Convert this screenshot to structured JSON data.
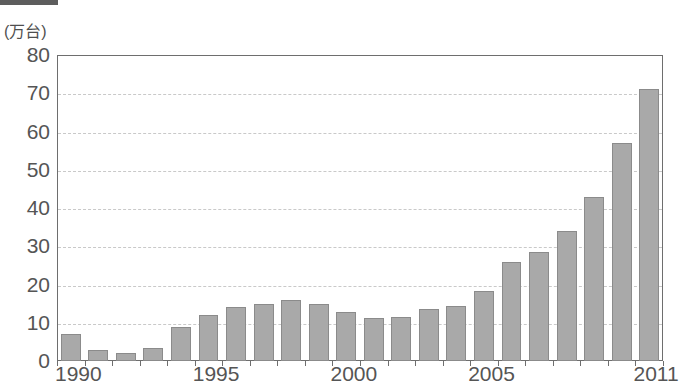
{
  "caption": {
    "tag_label": "",
    "text": ""
  },
  "chart_data": {
    "type": "bar",
    "title": "",
    "subtitle": "",
    "xlabel": "",
    "ylabel": "(万台)",
    "yunit_note": "万台",
    "ylim": [
      0,
      80
    ],
    "ytick_step": 10,
    "yticks": [
      "0",
      "10",
      "20",
      "30",
      "40",
      "50",
      "60",
      "70",
      "80"
    ],
    "grid": "horizontal-dashed",
    "legend": "none",
    "bar_color": "#a9a9a9",
    "bar_edge_color": "#8b8b8b",
    "axis_color": "#6e6e6e",
    "gridline_color": "#c9c9c9",
    "text_color": "#555555",
    "categories": [
      "1990",
      "1991",
      "1992",
      "1993",
      "1994",
      "1995",
      "1996",
      "1997",
      "1998",
      "1999",
      "2000",
      "2001",
      "2002",
      "2003",
      "2004",
      "2005",
      "2006",
      "2007",
      "2008",
      "2009",
      "2010",
      "2011"
    ],
    "values": [
      7,
      3,
      2,
      3.5,
      9,
      12,
      14,
      15,
      16,
      14.8,
      12.7,
      11.2,
      11.5,
      13.6,
      14.4,
      18.2,
      25.8,
      28.6,
      34,
      43,
      57,
      71
    ],
    "xtick_labels": [
      "1990",
      "1995",
      "2000",
      "2005",
      "2011"
    ],
    "xtick_categories": [
      "1990",
      "1995",
      "2000",
      "2005",
      "2011"
    ]
  }
}
